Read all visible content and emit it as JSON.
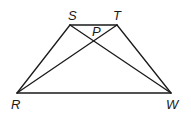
{
  "diagram": {
    "type": "trapezoid-with-diagonals",
    "points": {
      "S": {
        "label": "S",
        "x": 70,
        "y": 25,
        "lx": 68,
        "ly": 20
      },
      "T": {
        "label": "T",
        "x": 117,
        "y": 25,
        "lx": 113,
        "ly": 20
      },
      "R": {
        "label": "R",
        "x": 17,
        "y": 93,
        "lx": 11,
        "ly": 109
      },
      "W": {
        "label": "W",
        "x": 171,
        "y": 93,
        "lx": 166,
        "ly": 109
      },
      "P": {
        "label": "P",
        "x": 95,
        "y": 41,
        "lx": 92,
        "ly": 36
      }
    },
    "segments": [
      [
        "S",
        "T"
      ],
      [
        "T",
        "W"
      ],
      [
        "W",
        "R"
      ],
      [
        "R",
        "S"
      ],
      [
        "S",
        "W"
      ],
      [
        "R",
        "T"
      ]
    ],
    "stroke_color": "#1a1a1a"
  }
}
